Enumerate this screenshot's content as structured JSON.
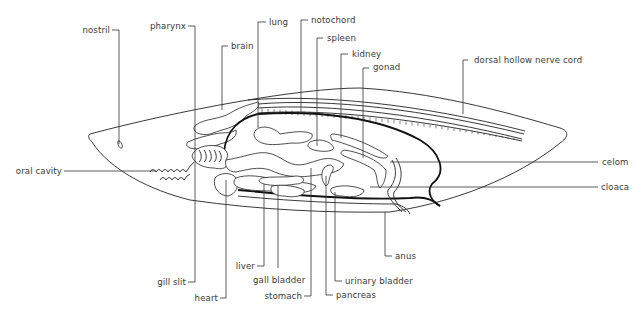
{
  "diagram": {
    "type": "anatomical cross-section",
    "labels": {
      "nostril": "nostril",
      "pharynx": "pharynx",
      "brain": "brain",
      "lung": "lung",
      "notochord": "notochord",
      "spleen": "spleen",
      "kidney": "kidney",
      "gonad": "gonad",
      "dorsal_hollow_nerve_cord": "dorsal hollow nerve cord",
      "oral_cavity": "oral cavity",
      "celom": "celom",
      "cloaca": "cloaca",
      "anus": "anus",
      "gill_slit": "gill slit",
      "heart": "heart",
      "liver": "liver",
      "gall_bladder": "gall bladder",
      "stomach": "stomach",
      "urinary_bladder": "urinary bladder",
      "pancreas": "pancreas"
    },
    "colors": {
      "background": "#ffffff",
      "line": "#222222",
      "text": "#3a3a3a"
    }
  }
}
